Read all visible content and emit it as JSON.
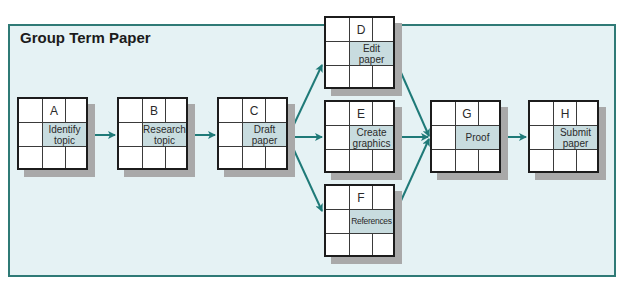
{
  "diagram": {
    "title": "Group Term Paper",
    "colors": {
      "panel_bg": "#e5f2f4",
      "panel_border": "#2f7a76",
      "arrow": "#1f7a78",
      "label_cell": "#c8dcdf",
      "shadow": "#a9a9a9"
    },
    "nodes": [
      {
        "id": "A",
        "label": "Identify topic"
      },
      {
        "id": "B",
        "label": "Research topic"
      },
      {
        "id": "C",
        "label": "Draft paper"
      },
      {
        "id": "D",
        "label": "Edit paper"
      },
      {
        "id": "E",
        "label": "Create graphics"
      },
      {
        "id": "F",
        "label": "References"
      },
      {
        "id": "G",
        "label": "Proof"
      },
      {
        "id": "H",
        "label": "Submit paper"
      }
    ],
    "edges": [
      [
        "A",
        "B"
      ],
      [
        "B",
        "C"
      ],
      [
        "C",
        "D"
      ],
      [
        "C",
        "E"
      ],
      [
        "C",
        "F"
      ],
      [
        "D",
        "G"
      ],
      [
        "E",
        "G"
      ],
      [
        "F",
        "G"
      ],
      [
        "G",
        "H"
      ]
    ]
  }
}
